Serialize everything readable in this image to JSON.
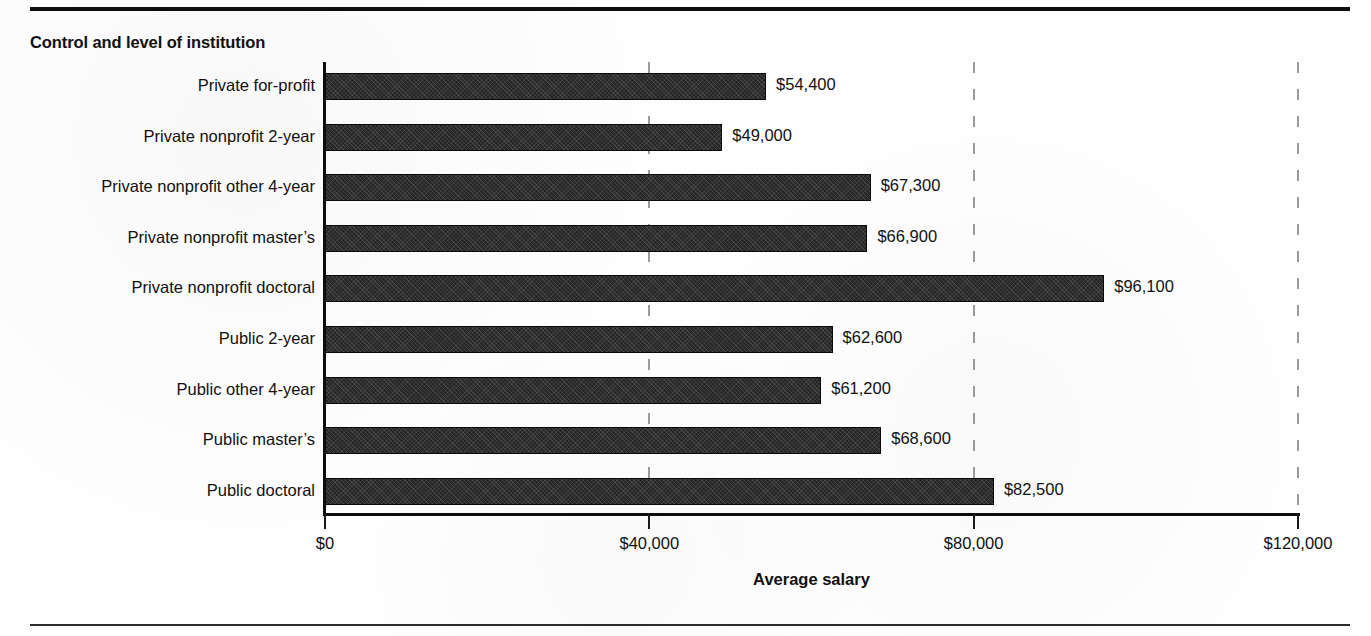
{
  "figure": {
    "panel_title": "Control and level of institution"
  },
  "chart_data": {
    "type": "bar",
    "orientation": "horizontal",
    "title": "",
    "subtitle": "",
    "xlabel": "Average salary",
    "ylabel": "Control and level of institution",
    "xlim": [
      0,
      120000
    ],
    "xticks": [
      0,
      40000,
      80000,
      120000
    ],
    "xtick_labels": [
      "$0",
      "$40,000",
      "$80,000",
      "$120,000"
    ],
    "grid": "vertical-dashed",
    "legend": "none",
    "bar_color": "#262626",
    "categories": [
      "Private for-profit",
      "Private nonprofit 2-year",
      "Private nonprofit other 4-year",
      "Private nonprofit master’s",
      "Private nonprofit doctoral",
      "Public 2-year",
      "Public other 4-year",
      "Public master’s",
      "Public doctoral"
    ],
    "values": [
      54400,
      49000,
      67300,
      66900,
      96100,
      62600,
      61200,
      68600,
      82500
    ],
    "value_labels": [
      "$54,400",
      "$49,000",
      "$67,300",
      "$66,900",
      "$96,100",
      "$62,600",
      "$61,200",
      "$68,600",
      "$82,500"
    ]
  }
}
